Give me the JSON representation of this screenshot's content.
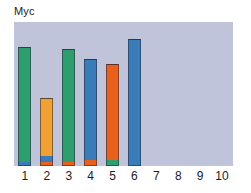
{
  "chart_data": {
    "type": "bar",
    "title": "Myc",
    "subtitle": "",
    "xlabel": "",
    "ylabel": "",
    "grid": false,
    "legend": "none",
    "stacked": true,
    "ylim": [
      0,
      100
    ],
    "categories": [
      "1",
      "2",
      "3",
      "4",
      "5",
      "6",
      "7",
      "8",
      "9",
      "10"
    ],
    "series": [
      {
        "name": "green",
        "color": "#2e9e6f",
        "values": [
          80,
          0,
          78,
          0,
          4,
          0,
          0,
          0,
          0,
          0
        ]
      },
      {
        "name": "blue",
        "color": "#3a7cb8",
        "values": [
          3,
          4,
          0,
          70,
          0,
          88,
          0,
          0,
          0,
          0
        ]
      },
      {
        "name": "orange",
        "color": "#e8601c",
        "values": [
          0,
          3,
          3,
          4,
          67,
          0,
          0,
          0,
          0,
          0
        ]
      },
      {
        "name": "amber",
        "color": "#f0a132",
        "values": [
          0,
          40,
          0,
          0,
          0,
          0,
          0,
          0,
          0,
          0
        ]
      }
    ],
    "bars": [
      {
        "category": "1",
        "total": 83,
        "segments": [
          {
            "series": "blue",
            "color": "#3a7cb8",
            "value": 3
          },
          {
            "series": "green",
            "color": "#2e9e6f",
            "value": 80
          }
        ]
      },
      {
        "category": "2",
        "total": 47,
        "segments": [
          {
            "series": "orange",
            "color": "#e8601c",
            "value": 3
          },
          {
            "series": "blue",
            "color": "#3a7cb8",
            "value": 4
          },
          {
            "series": "amber",
            "color": "#f0a132",
            "value": 40
          }
        ]
      },
      {
        "category": "3",
        "total": 81,
        "segments": [
          {
            "series": "orange",
            "color": "#e8601c",
            "value": 3
          },
          {
            "series": "green",
            "color": "#2e9e6f",
            "value": 78
          }
        ]
      },
      {
        "category": "4",
        "total": 74,
        "segments": [
          {
            "series": "orange",
            "color": "#e8601c",
            "value": 4
          },
          {
            "series": "blue",
            "color": "#3a7cb8",
            "value": 70
          }
        ]
      },
      {
        "category": "5",
        "total": 71,
        "segments": [
          {
            "series": "green",
            "color": "#2e9e6f",
            "value": 4
          },
          {
            "series": "orange",
            "color": "#e8601c",
            "value": 67
          }
        ]
      },
      {
        "category": "6",
        "total": 88,
        "segments": [
          {
            "series": "blue",
            "color": "#3a7cb8",
            "value": 88
          }
        ]
      },
      {
        "category": "7",
        "total": 0,
        "segments": []
      },
      {
        "category": "8",
        "total": 0,
        "segments": []
      },
      {
        "category": "9",
        "total": 0,
        "segments": []
      },
      {
        "category": "10",
        "total": 0,
        "segments": []
      }
    ]
  },
  "style": {
    "plot_background": "#bfc4da",
    "figure_background": "#ffffff",
    "text_color": "#1c1c1c"
  }
}
